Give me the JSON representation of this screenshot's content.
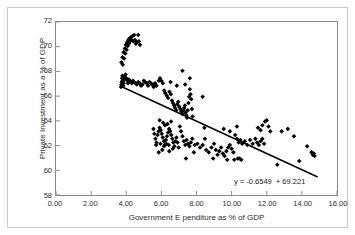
{
  "chart_data": {
    "type": "scatter",
    "title": "",
    "subtitle": "",
    "xlabel": "Government E  penditure as % of GDP",
    "ylabel": "Private Investment as a % of GDP",
    "xlim": [
      0.0,
      16.0
    ],
    "ylim": [
      58,
      72
    ],
    "xticks": [
      "0.00",
      "2.00",
      "4.00",
      "6.00",
      "8.00",
      "10.00",
      "12.00",
      "14.00",
      "16.00"
    ],
    "xtick_values": [
      0,
      2,
      4,
      6,
      8,
      10,
      12,
      14,
      16
    ],
    "yticks": [
      "58",
      "60",
      "62",
      "64",
      "66",
      "68",
      "70",
      "72"
    ],
    "ytick_values": [
      58,
      60,
      62,
      64,
      66,
      68,
      70,
      72
    ],
    "grid": false,
    "legend": false,
    "legend_position": "none",
    "marker": "diamond",
    "marker_color": "#000000",
    "marker_size": 2.3,
    "annotations": [
      {
        "text": "y = -0.6549  + 69.221",
        "x": 10.6,
        "y": 58.9,
        "role": "trendline-equation"
      }
    ],
    "trendline": {
      "type": "linear",
      "slope": -0.6549,
      "intercept": 69.221,
      "color": "#000000",
      "width": 1.6,
      "x_start": 3.75,
      "x_end": 14.9,
      "y_start": 66.76,
      "y_end": 59.46
    },
    "series": [
      {
        "name": "Observations",
        "points": [
          [
            3.72,
            68.75
          ],
          [
            3.78,
            69.15
          ],
          [
            3.8,
            68.55
          ],
          [
            3.85,
            69.55
          ],
          [
            3.88,
            69.05
          ],
          [
            3.92,
            69.85
          ],
          [
            3.95,
            69.45
          ],
          [
            3.98,
            70.15
          ],
          [
            4.02,
            69.75
          ],
          [
            4.05,
            70.35
          ],
          [
            4.08,
            70.05
          ],
          [
            4.12,
            70.55
          ],
          [
            4.15,
            70.25
          ],
          [
            4.18,
            70.65
          ],
          [
            4.22,
            70.45
          ],
          [
            4.25,
            70.75
          ],
          [
            4.3,
            70.55
          ],
          [
            4.35,
            70.85
          ],
          [
            4.4,
            70.45
          ],
          [
            4.45,
            70.95
          ],
          [
            4.5,
            70.55
          ],
          [
            4.55,
            70.25
          ],
          [
            4.6,
            70.35
          ],
          [
            4.68,
            70.95
          ],
          [
            4.72,
            70.45
          ],
          [
            4.78,
            70.15
          ],
          [
            3.7,
            66.75
          ],
          [
            3.72,
            66.95
          ],
          [
            3.74,
            67.15
          ],
          [
            3.76,
            67.45
          ],
          [
            3.78,
            67.65
          ],
          [
            3.8,
            67.25
          ],
          [
            3.82,
            66.85
          ],
          [
            3.85,
            67.05
          ],
          [
            3.88,
            67.35
          ],
          [
            3.92,
            67.55
          ],
          [
            3.96,
            67.75
          ],
          [
            4.0,
            67.45
          ],
          [
            4.05,
            67.25
          ],
          [
            4.1,
            67.05
          ],
          [
            4.14,
            67.35
          ],
          [
            4.2,
            67.25
          ],
          [
            4.26,
            67.15
          ],
          [
            4.32,
            67.05
          ],
          [
            4.38,
            67.25
          ],
          [
            4.44,
            67.15
          ],
          [
            4.52,
            67.05
          ],
          [
            4.6,
            66.95
          ],
          [
            4.68,
            67.15
          ],
          [
            4.76,
            67.05
          ],
          [
            4.84,
            66.85
          ],
          [
            4.92,
            66.95
          ],
          [
            5.0,
            67.25
          ],
          [
            5.08,
            67.15
          ],
          [
            5.16,
            67.05
          ],
          [
            5.24,
            66.85
          ],
          [
            5.32,
            67.15
          ],
          [
            5.4,
            67.05
          ],
          [
            5.48,
            66.95
          ],
          [
            5.56,
            66.75
          ],
          [
            5.64,
            67.05
          ],
          [
            5.72,
            66.85
          ],
          [
            5.85,
            67.25
          ],
          [
            5.92,
            67.45
          ],
          [
            6.0,
            67.25
          ],
          [
            6.08,
            67.05
          ],
          [
            6.16,
            66.45
          ],
          [
            6.22,
            66.25
          ],
          [
            6.3,
            66.05
          ],
          [
            6.38,
            65.85
          ],
          [
            6.46,
            66.35
          ],
          [
            6.54,
            66.15
          ],
          [
            6.6,
            65.65
          ],
          [
            6.66,
            65.45
          ],
          [
            6.72,
            65.25
          ],
          [
            6.78,
            65.05
          ],
          [
            6.84,
            64.85
          ],
          [
            6.9,
            65.35
          ],
          [
            6.96,
            65.55
          ],
          [
            7.02,
            65.15
          ],
          [
            7.08,
            64.95
          ],
          [
            7.14,
            64.75
          ],
          [
            7.2,
            64.55
          ],
          [
            7.26,
            64.85
          ],
          [
            7.3,
            65.05
          ],
          [
            7.34,
            65.25
          ],
          [
            7.38,
            64.65
          ],
          [
            7.42,
            64.45
          ],
          [
            7.46,
            64.25
          ],
          [
            7.5,
            64.85
          ],
          [
            7.54,
            65.45
          ],
          [
            7.58,
            65.95
          ],
          [
            7.62,
            66.55
          ],
          [
            7.66,
            66.15
          ],
          [
            7.7,
            65.75
          ],
          [
            7.74,
            64.95
          ],
          [
            7.78,
            64.35
          ],
          [
            7.2,
            68.05
          ],
          [
            7.35,
            66.95
          ],
          [
            7.62,
            67.45
          ],
          [
            6.52,
            67.15
          ],
          [
            6.88,
            66.85
          ],
          [
            8.35,
            65.95
          ],
          [
            5.55,
            63.35
          ],
          [
            5.6,
            62.95
          ],
          [
            5.66,
            62.55
          ],
          [
            5.72,
            62.25
          ],
          [
            5.78,
            62.85
          ],
          [
            5.84,
            63.15
          ],
          [
            5.9,
            63.45
          ],
          [
            5.96,
            63.25
          ],
          [
            6.02,
            62.95
          ],
          [
            6.08,
            62.65
          ],
          [
            6.14,
            62.35
          ],
          [
            6.2,
            62.05
          ],
          [
            6.26,
            62.45
          ],
          [
            6.32,
            62.75
          ],
          [
            6.38,
            63.05
          ],
          [
            6.44,
            63.35
          ],
          [
            6.5,
            63.15
          ],
          [
            6.56,
            62.85
          ],
          [
            6.62,
            62.55
          ],
          [
            6.68,
            62.25
          ],
          [
            6.74,
            61.95
          ],
          [
            6.8,
            62.35
          ],
          [
            6.86,
            62.65
          ],
          [
            6.92,
            62.25
          ],
          [
            6.98,
            61.85
          ],
          [
            5.85,
            61.45
          ],
          [
            6.05,
            61.65
          ],
          [
            6.45,
            61.55
          ],
          [
            6.65,
            61.75
          ],
          [
            7.05,
            63.55
          ],
          [
            7.12,
            63.15
          ],
          [
            7.2,
            62.75
          ],
          [
            7.28,
            62.35
          ],
          [
            7.36,
            62.05
          ],
          [
            7.44,
            62.45
          ],
          [
            7.52,
            62.15
          ],
          [
            7.6,
            61.95
          ],
          [
            7.68,
            62.25
          ],
          [
            7.76,
            62.55
          ],
          [
            7.9,
            62.05
          ],
          [
            8.05,
            62.15
          ],
          [
            8.2,
            61.85
          ],
          [
            8.35,
            62.05
          ],
          [
            8.48,
            62.55
          ],
          [
            8.55,
            61.65
          ],
          [
            8.7,
            61.45
          ],
          [
            8.85,
            61.85
          ],
          [
            9.0,
            62.15
          ],
          [
            9.1,
            61.65
          ],
          [
            9.2,
            61.25
          ],
          [
            9.3,
            61.55
          ],
          [
            9.4,
            61.85
          ],
          [
            9.5,
            61.35
          ],
          [
            9.6,
            61.15
          ],
          [
            9.7,
            61.55
          ],
          [
            9.8,
            61.85
          ],
          [
            9.9,
            62.05
          ],
          [
            10.0,
            61.75
          ],
          [
            10.1,
            61.45
          ],
          [
            8.45,
            63.45
          ],
          [
            9.55,
            63.35
          ],
          [
            9.9,
            63.15
          ],
          [
            10.3,
            63.55
          ],
          [
            10.2,
            62.85
          ],
          [
            10.3,
            62.55
          ],
          [
            10.4,
            62.25
          ],
          [
            10.5,
            62.45
          ],
          [
            10.6,
            62.15
          ],
          [
            10.15,
            60.85
          ],
          [
            10.35,
            60.95
          ],
          [
            10.55,
            60.85
          ],
          [
            10.75,
            62.35
          ],
          [
            10.9,
            62.05
          ],
          [
            11.05,
            62.45
          ],
          [
            11.2,
            62.15
          ],
          [
            11.35,
            62.55
          ],
          [
            11.45,
            62.25
          ],
          [
            11.55,
            62.05
          ],
          [
            11.65,
            62.35
          ],
          [
            11.75,
            62.55
          ],
          [
            11.85,
            62.15
          ],
          [
            11.5,
            63.45
          ],
          [
            11.65,
            63.25
          ],
          [
            11.75,
            63.65
          ],
          [
            11.9,
            63.95
          ],
          [
            12.0,
            64.05
          ],
          [
            12.1,
            63.55
          ],
          [
            12.2,
            63.15
          ],
          [
            12.6,
            60.45
          ],
          [
            12.85,
            63.15
          ],
          [
            13.2,
            63.35
          ],
          [
            13.55,
            62.75
          ],
          [
            13.85,
            60.75
          ],
          [
            14.3,
            61.95
          ],
          [
            14.55,
            61.45
          ],
          [
            14.62,
            61.25
          ],
          [
            14.68,
            61.35
          ],
          [
            14.72,
            61.15
          ],
          [
            9.75,
            60.85
          ],
          [
            8.95,
            60.95
          ],
          [
            7.85,
            61.45
          ],
          [
            7.4,
            60.95
          ],
          [
            10.45,
            60.95
          ],
          [
            5.9,
            64.05
          ],
          [
            6.1,
            63.85
          ],
          [
            6.2,
            63.65
          ],
          [
            6.35,
            63.75
          ],
          [
            6.55,
            63.95
          ],
          [
            5.7,
            62.05
          ],
          [
            5.95,
            62.15
          ],
          [
            6.15,
            61.95
          ],
          [
            6.28,
            62.15
          ],
          [
            6.42,
            62.05
          ]
        ]
      }
    ]
  }
}
